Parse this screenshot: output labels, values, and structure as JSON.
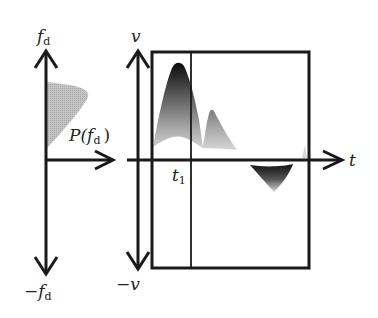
{
  "diagram": {
    "type": "doppler-spectrum-and-velocity-time",
    "left_panel": {
      "y_axis_top_label": "f",
      "y_axis_top_sub": "d",
      "y_axis_bottom_label": "−f",
      "y_axis_bottom_sub": "d",
      "x_axis_label_prefix": "P(f",
      "x_axis_label_sub": "d",
      "x_axis_label_suffix": ")",
      "spectrum_fill": "#b8b8b8"
    },
    "right_panel": {
      "y_axis_top_label": "v",
      "y_axis_bottom_label": "−v",
      "x_axis_label": "t",
      "marker_label": "t",
      "marker_sub": "1",
      "positive_waveform": "gray-to-black gradient, two peaks above axis",
      "negative_waveform": "dark inverted lobe below axis"
    },
    "colors": {
      "line": "#1a1a1a",
      "waveform_dark": "#111111",
      "waveform_light": "#d0d0d0",
      "background": "#ffffff"
    }
  }
}
